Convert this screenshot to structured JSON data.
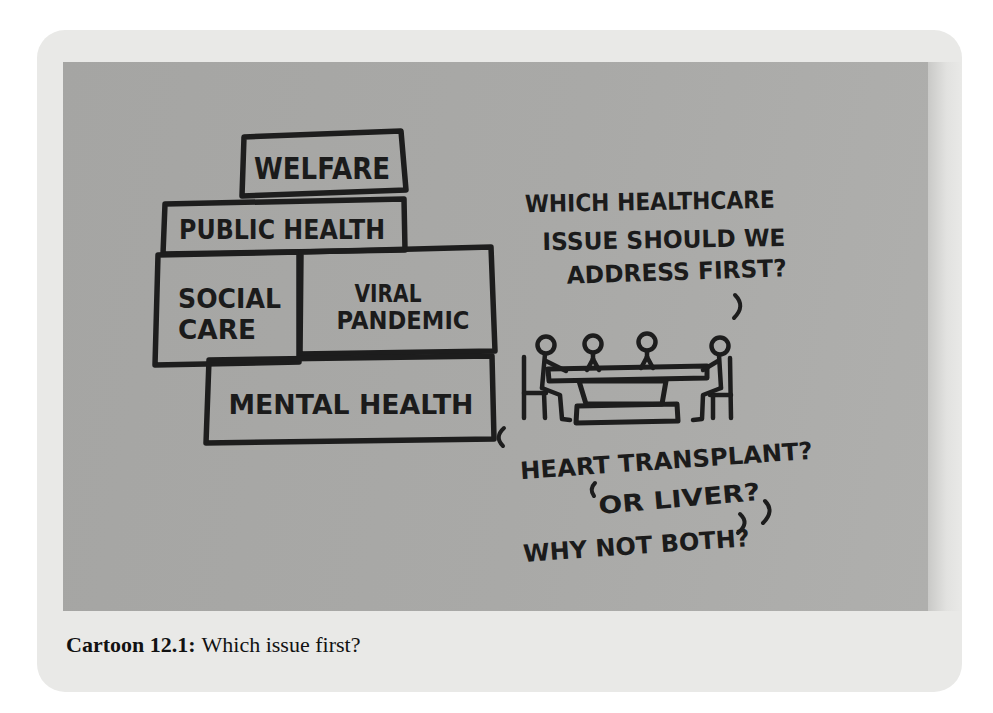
{
  "colors": {
    "page_background": "#ffffff",
    "card_background": "#e9e9e7",
    "photo_background": "#a8a8a6",
    "ink": "#1d1d1d"
  },
  "cartoon": {
    "blocks": {
      "welfare": "WELFARE",
      "public_health": "PUBLIC HEALTH",
      "social_line1": "SOCIAL",
      "social_line2": "CARE",
      "viral_line1": "VIRAL",
      "viral_line2": "PANDEMIC",
      "mental_health": "MENTAL HEALTH"
    },
    "question": {
      "line1": "WHICH HEALTHCARE",
      "line2": "ISSUE SHOULD WE",
      "line3": "ADDRESS FIRST?"
    },
    "answers": {
      "line1": "HEART TRANSPLANT?",
      "line2": "OR LIVER?",
      "line3": "WHY NOT BOTH?"
    }
  },
  "caption": {
    "label": "Cartoon 12.1:",
    "text": "Which issue first?"
  }
}
